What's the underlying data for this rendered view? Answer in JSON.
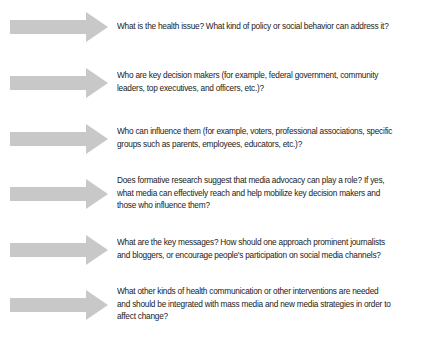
{
  "colors": {
    "arrow": "#c8c8c8",
    "text": "#222222"
  },
  "steps": [
    {
      "icon": "right-arrow-icon",
      "text": "What is the health issue? What kind of policy or social behavior can address it?"
    },
    {
      "icon": "right-arrow-icon",
      "text": "Who are key decision makers (for example, federal government, community leaders, top executives, and officers, etc.)?"
    },
    {
      "icon": "right-arrow-icon",
      "text": "Who can influence them (for example, voters, professional associations, specific groups such as parents, employees, educators, etc.)?"
    },
    {
      "icon": "right-arrow-icon",
      "text": "Does formative research suggest that media advocacy can play a role? If yes, what media can effectively reach and help mobilize key decision makers and those who influence them?"
    },
    {
      "icon": "right-arrow-icon",
      "text": "What are the key messages? How should one approach prominent journalists and bloggers, or encourage people's participation on social media channels?"
    },
    {
      "icon": "right-arrow-icon",
      "text": "What other kinds of health communication or other interventions are needed and should be integrated with mass media and new media strategies in order to affect change?"
    }
  ]
}
